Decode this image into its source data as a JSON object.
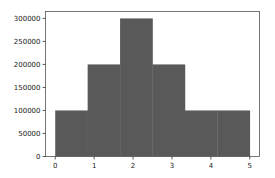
{
  "chart_data": {
    "type": "bar",
    "subtype": "histogram",
    "title": "",
    "xlabel": "",
    "ylabel": "",
    "bins": [
      {
        "x0": 0.0,
        "x1": 0.8333,
        "value": 100000
      },
      {
        "x0": 0.8333,
        "x1": 1.6667,
        "value": 200000
      },
      {
        "x0": 1.6667,
        "x1": 2.5,
        "value": 300000
      },
      {
        "x0": 2.5,
        "x1": 3.3333,
        "value": 200000
      },
      {
        "x0": 3.3333,
        "x1": 4.1667,
        "value": 100000
      },
      {
        "x0": 4.1667,
        "x1": 5.0,
        "value": 100000
      }
    ],
    "categories": [
      "0-0.83",
      "0.83-1.67",
      "1.67-2.5",
      "2.5-3.33",
      "3.33-4.17",
      "4.17-5"
    ],
    "values": [
      100000,
      200000,
      300000,
      200000,
      100000,
      100000
    ],
    "xlim": [
      -0.25,
      5.25
    ],
    "ylim": [
      0,
      315000
    ],
    "xticks": [
      "0",
      "1",
      "2",
      "3",
      "4",
      "5"
    ],
    "yticks": [
      "0",
      "50000",
      "100000",
      "150000",
      "200000",
      "250000",
      "300000"
    ],
    "grid": false,
    "legend": null,
    "bar_color": "#595959"
  }
}
